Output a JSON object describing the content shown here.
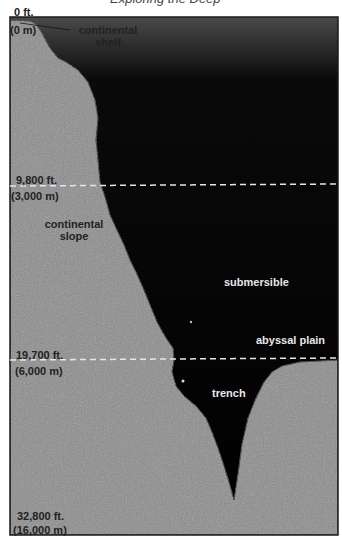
{
  "caption": "Exploring the Deep",
  "depth_markers": [
    {
      "feet": "0 ft.",
      "meters": "(0 m)"
    },
    {
      "feet": "9,800 ft.",
      "meters": "(3,000 m)"
    },
    {
      "feet": "19,700 ft.",
      "meters": "(6,000 m)"
    },
    {
      "feet": "32,800 ft.",
      "meters": "(16,000 m)"
    }
  ],
  "labels": {
    "continental_shelf": [
      "continental",
      "shelf"
    ],
    "continental_slope": [
      "continental",
      "slope"
    ],
    "submersible": "submersible",
    "abyssal_plain": "abyssal plain",
    "trench": "trench"
  },
  "colors": {
    "seabed": "#8c8c8c",
    "ocean_deep": "#000000",
    "ocean_surface": "#3a3a3a",
    "dashed_line": "#e6e6e6",
    "frame": "#1a1a1a"
  }
}
